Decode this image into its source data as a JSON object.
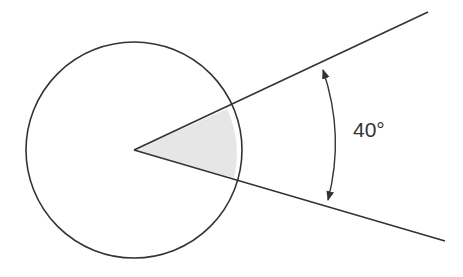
{
  "diagram": {
    "type": "circle-sector-angle",
    "angle_label": "40°",
    "angle_degrees": 40,
    "colors": {
      "stroke": "#333333",
      "sector_fill": "#e6e6e6",
      "background": "#ffffff"
    }
  }
}
